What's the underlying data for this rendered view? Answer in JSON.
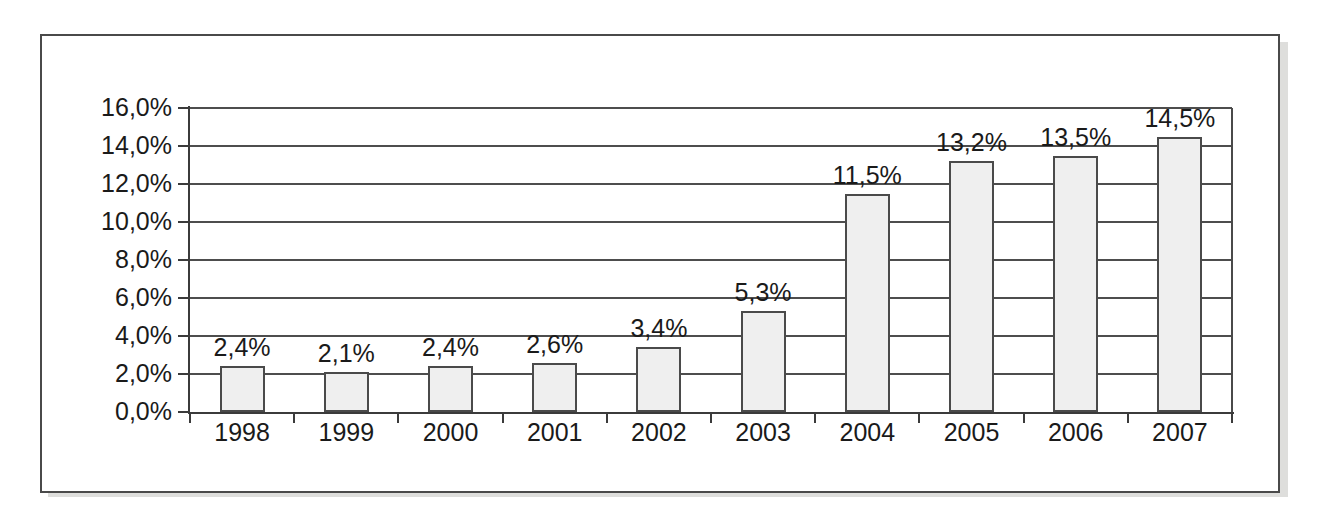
{
  "chart_data": {
    "type": "bar",
    "title": "",
    "subtitle": "",
    "xlabel": "",
    "ylabel": "",
    "categories": [
      "1998",
      "1999",
      "2000",
      "2001",
      "2002",
      "2003",
      "2004",
      "2005",
      "2006",
      "2007"
    ],
    "values": [
      2.4,
      2.1,
      2.4,
      2.6,
      3.4,
      5.3,
      11.5,
      13.2,
      13.5,
      14.5
    ],
    "value_labels": [
      "2,4%",
      "2,1%",
      "2,4%",
      "2,6%",
      "3,4%",
      "5,3%",
      "11,5%",
      "13,2%",
      "13,5%",
      "14,5%"
    ],
    "ylim": [
      0,
      16
    ],
    "ytick_values": [
      0,
      2,
      4,
      6,
      8,
      10,
      12,
      14,
      16
    ],
    "ytick_labels": [
      "0,0%",
      "2,0%",
      "4,0%",
      "6,0%",
      "8,0%",
      "10,0%",
      "12,0%",
      "14,0%",
      "16,0%"
    ],
    "grid": true,
    "legend": "none",
    "decimal_separator": ",",
    "unit": "%",
    "colors": {
      "bar_fill": "#efefef",
      "bar_border": "#4a4a4a",
      "gridline": "#4d4d4d",
      "axis": "#3b3b3b",
      "text": "#1a1a1a",
      "frame_border": "#4a4a4a",
      "frame_background": "#ffffff",
      "shadow": "#d8d8d6"
    }
  }
}
